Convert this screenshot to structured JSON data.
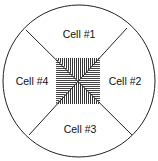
{
  "diagram": {
    "title": "",
    "cells": [
      {
        "id": 1,
        "label": "Cell #1",
        "position": "top"
      },
      {
        "id": 2,
        "label": "Cell #2",
        "position": "right"
      },
      {
        "id": 3,
        "label": "Cell #3",
        "position": "bottom"
      },
      {
        "id": 4,
        "label": "Cell #4",
        "position": "left"
      }
    ],
    "center": {
      "pattern": "hatched",
      "description": "shared central region"
    },
    "colors": {
      "line": "#222222",
      "background": "#ffffff",
      "hatch": "#333333"
    }
  }
}
